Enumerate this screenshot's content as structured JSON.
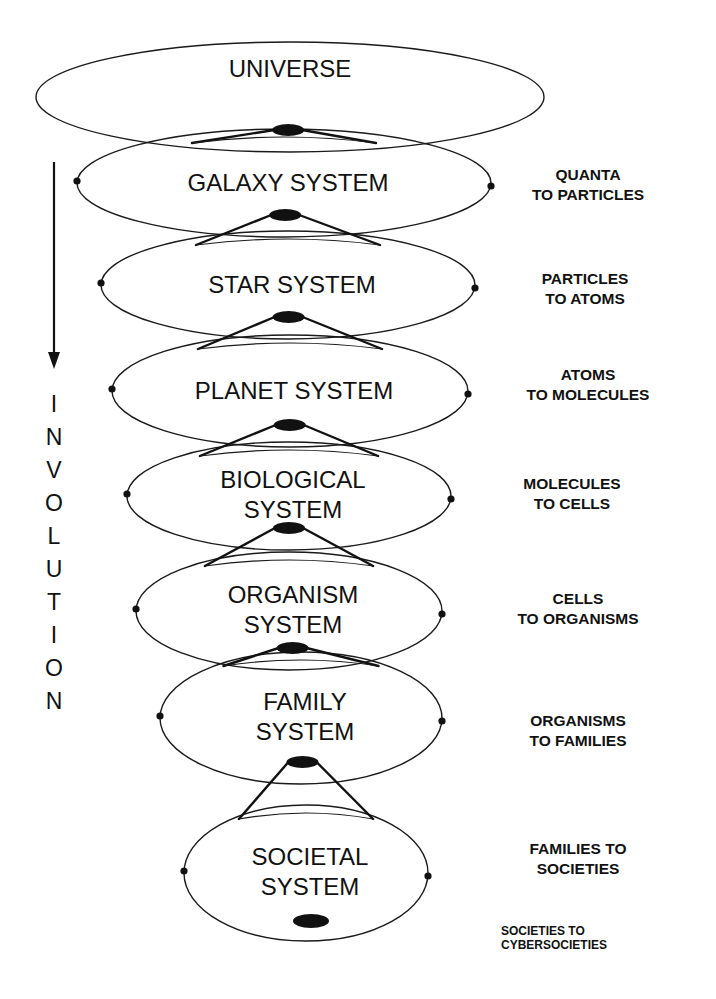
{
  "diagram": {
    "type": "nested-hierarchy",
    "direction_label": "INVOLUTION",
    "direction_letters": [
      "I",
      "N",
      "V",
      "O",
      "L",
      "U",
      "T",
      "I",
      "O",
      "N"
    ],
    "arrow": "down-arrow",
    "colors": {
      "ink": "#111111",
      "background": "#ffffff"
    },
    "systems": [
      {
        "id": "universe",
        "lines": [
          "UNIVERSE"
        ],
        "cx": 290,
        "cy": 97,
        "rx": 254,
        "ry": 55,
        "side_dots": false
      },
      {
        "id": "galaxy",
        "lines": [
          "GALAXY SYSTEM"
        ],
        "cx": 284,
        "cy": 183,
        "rx": 207,
        "ry": 54,
        "side_dots": true
      },
      {
        "id": "star",
        "lines": [
          "STAR SYSTEM"
        ],
        "cx": 288,
        "cy": 285,
        "rx": 187,
        "ry": 54,
        "side_dots": true
      },
      {
        "id": "planet",
        "lines": [
          "PLANET SYSTEM"
        ],
        "cx": 290,
        "cy": 391,
        "rx": 178,
        "ry": 56,
        "side_dots": true
      },
      {
        "id": "biological",
        "lines": [
          "BIOLOGICAL",
          "SYSTEM"
        ],
        "cx": 289,
        "cy": 496,
        "rx": 162,
        "ry": 54,
        "side_dots": true
      },
      {
        "id": "organism",
        "lines": [
          "ORGANISM",
          "SYSTEM"
        ],
        "cx": 289,
        "cy": 611,
        "rx": 153,
        "ry": 59,
        "side_dots": true
      },
      {
        "id": "family",
        "lines": [
          "FAMILY",
          "SYSTEM"
        ],
        "cx": 301,
        "cy": 718,
        "rx": 141,
        "ry": 66,
        "side_dots": true
      },
      {
        "id": "societal",
        "lines": [
          "SOCIETAL",
          "SYSTEM"
        ],
        "cx": 306,
        "cy": 873,
        "rx": 122,
        "ry": 68,
        "side_dots": true
      }
    ],
    "transitions": [
      {
        "lines": [
          "QUANTA",
          "TO PARTICLES"
        ],
        "x": 588,
        "y": 180
      },
      {
        "lines": [
          "PARTICLES",
          "TO ATOMS"
        ],
        "x": 585,
        "y": 284
      },
      {
        "lines": [
          "ATOMS",
          "TO MOLECULES"
        ],
        "x": 588,
        "y": 380
      },
      {
        "lines": [
          "MOLECULES",
          "TO CELLS"
        ],
        "x": 572,
        "y": 489
      },
      {
        "lines": [
          "CELLS",
          "TO ORGANISMS"
        ],
        "x": 578,
        "y": 604
      },
      {
        "lines": [
          "ORGANISMS",
          "TO FAMILIES"
        ],
        "x": 578,
        "y": 726
      },
      {
        "lines": [
          "FAMILIES TO",
          "SOCIETIES"
        ],
        "x": 578,
        "y": 854
      },
      {
        "lines": [
          "SOCIETIES TO",
          "CYBERSOCIETIES"
        ],
        "x": 501,
        "y": 935,
        "small": true
      }
    ]
  }
}
